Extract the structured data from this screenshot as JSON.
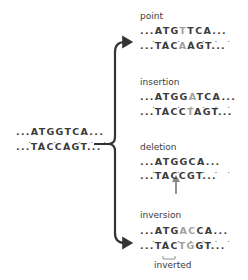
{
  "original": {
    "top": "...ATGGTCA...",
    "bottom": "...TACCAGT..."
  },
  "mutations": [
    {
      "label": "point",
      "top": {
        "pre": "...ATG",
        "hl": "T",
        "post": "TCA..."
      },
      "bottom": {
        "pre": "...TAC",
        "hl": "A",
        "post": "AGT..."
      }
    },
    {
      "label": "insertion",
      "top": {
        "pre": "...ATGG",
        "hl": "A",
        "post": "TCA..."
      },
      "bottom": {
        "pre": "...TACC",
        "hl": "T",
        "post": "AGT..."
      }
    },
    {
      "label": "deletion",
      "top": {
        "pre": "...ATGGCA...",
        "hl": "",
        "post": ""
      },
      "bottom": {
        "pre": "...TACCGT...",
        "hl": "",
        "post": ""
      }
    },
    {
      "label": "inversion",
      "top": {
        "pre": "...ATG",
        "hl": "AC",
        "post": "CA..."
      },
      "bottom": {
        "pre": "...TAC",
        "hl": "TG",
        "post": "GT..."
      },
      "annotation": "inverted"
    }
  ],
  "dots": ". . . . . . .",
  "colors": {
    "text": "#3b3b3b",
    "highlight": "#a0a0a0",
    "bracket": "#333333",
    "deletion_arrow": "#888888"
  }
}
